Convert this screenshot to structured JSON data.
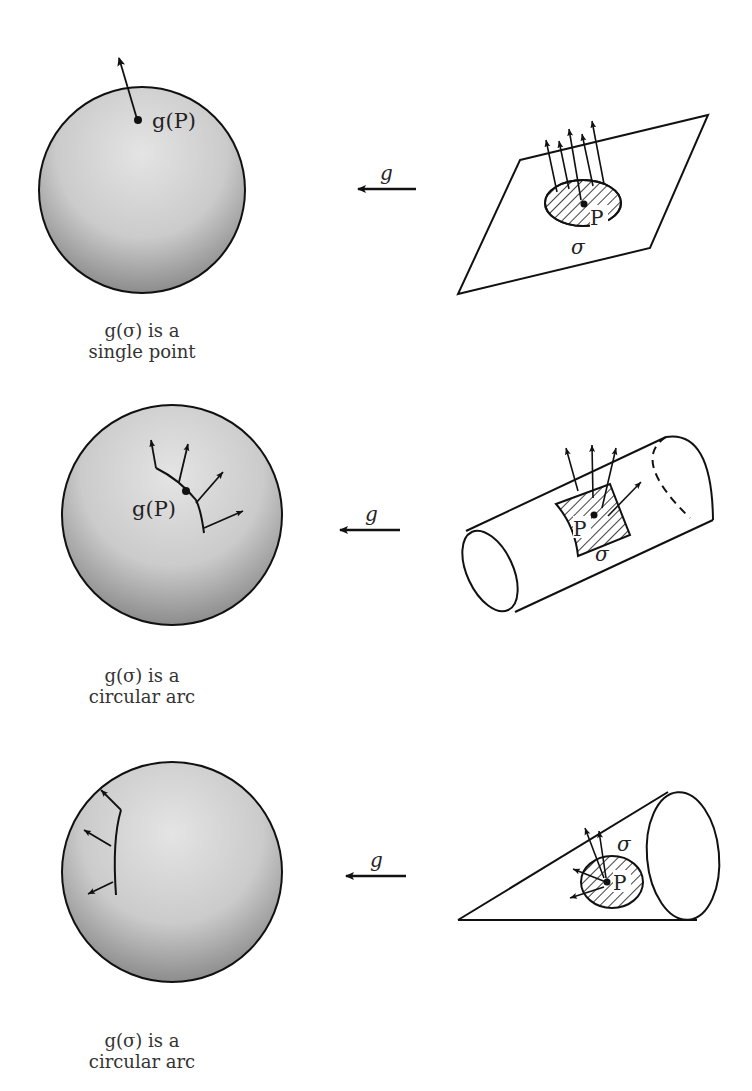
{
  "figure": {
    "rows": [
      {
        "surface": "plane",
        "map_label": "g",
        "point_label": "P",
        "region_label": "σ",
        "image_point_label": "g(P)",
        "caption_line1": "g(σ) is a",
        "caption_line2": "single point"
      },
      {
        "surface": "cylinder",
        "map_label": "g",
        "point_label": "P",
        "region_label": "σ",
        "image_point_label": "g(P)",
        "caption_line1": "g(σ) is a",
        "caption_line2": "circular arc"
      },
      {
        "surface": "cone",
        "map_label": "g",
        "point_label": "P",
        "region_label": "σ",
        "image_point_label": "",
        "caption_line1": "g(σ) is a",
        "caption_line2": "circular arc"
      }
    ]
  },
  "colors": {
    "ink": "#111111",
    "sphere_light": "#e2e2e2",
    "sphere_dark": "#8a8a8a"
  }
}
